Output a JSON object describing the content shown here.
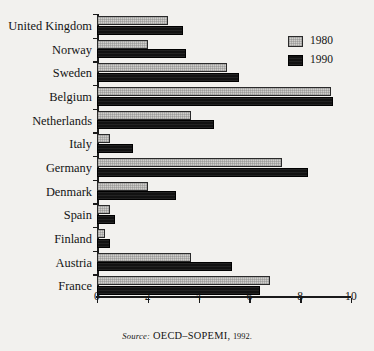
{
  "chart_data": {
    "type": "bar",
    "orientation": "horizontal",
    "title": "",
    "xlabel": "",
    "ylabel": "",
    "xlim": [
      0,
      10
    ],
    "xticks": [
      0,
      2,
      4,
      6,
      8,
      10
    ],
    "xtick_labels": [
      "0",
      "2",
      "4",
      "6",
      "8",
      "10"
    ],
    "grid": false,
    "legend_position": "top-right",
    "categories": [
      "United Kingdom",
      "Norway",
      "Sweden",
      "Belgium",
      "Netherlands",
      "Italy",
      "Germany",
      "Denmark",
      "Spain",
      "Finland",
      "Austria",
      "France"
    ],
    "series": [
      {
        "name": "1980",
        "color": "#cfcecb",
        "values": [
          2.8,
          2.0,
          5.1,
          9.2,
          3.7,
          0.5,
          7.3,
          2.0,
          0.5,
          0.3,
          3.7,
          6.8
        ]
      },
      {
        "name": "1990",
        "color": "#121212",
        "values": [
          3.4,
          3.5,
          5.6,
          9.3,
          4.6,
          1.4,
          8.3,
          3.1,
          0.7,
          0.5,
          5.3,
          6.4
        ]
      }
    ]
  },
  "legend": {
    "items": [
      {
        "label": "1980",
        "swatch": "#cfcecb"
      },
      {
        "label": "1990",
        "swatch": "#121212"
      }
    ]
  },
  "source_note": {
    "label": "Source:",
    "text": "OECD–SOPEMI,",
    "year": "1992."
  }
}
